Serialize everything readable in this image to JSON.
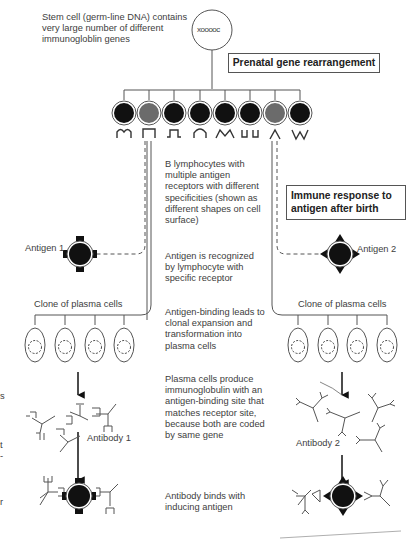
{
  "header": {
    "stem_cell_caption": "Stem cell (germ-line DNA) contains\nvery large number of different\nimmunogloblin genes",
    "stem_cell_glyph": "xooooc",
    "prenatal_box": "Prenatal gene rearrangement"
  },
  "lymphocytes": {
    "count": 8,
    "highlighted_indices": [
      1,
      6
    ],
    "receptor_shapes": [
      "m-shape",
      "square-cup",
      "omega-step",
      "arch",
      "double-v",
      "double-u",
      "caret",
      "w-shape"
    ],
    "colors": {
      "dark": "#111111",
      "highlighted": "#6b6b6b"
    }
  },
  "captions": {
    "b_lymphocytes": "B lymphocytes with\nmultiple antigen\nreceptors with different\nspecificities (shown as\ndifferent shapes on cell\nsurface)",
    "immune_response_box": "Immune response to\nantigen after birth",
    "antigen_recognized": "Antigen is recognized\nby lymphocyte with\nspecific receptor",
    "clonal_expansion": "Antigen-binding leads to\nclonal expansion and\ntransformation into\nplasma cells",
    "plasma_produce": "Plasma cells produce\nimmunoglobulin with an\nantigen-binding site that\nmatches receptor site,\nbecause both are coded\nby same gene",
    "antibody_binds": "Antibody binds with\ninducing antigen"
  },
  "left_branch": {
    "antigen_label": "Antigen 1",
    "clone_label": "Clone of plasma cells",
    "antibody_label": "Antibody 1"
  },
  "right_branch": {
    "antigen_label": "Antigen 2",
    "clone_label": "Clone of plasma cells",
    "antibody_label": "Antibody 2"
  },
  "left_edge_fragments": [
    "s",
    "t",
    "-",
    "r"
  ]
}
